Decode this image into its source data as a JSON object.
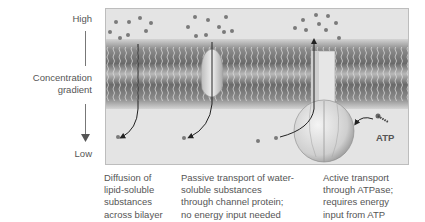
{
  "gradient_axis": {
    "high_label": "High",
    "title_line1": "Concentration",
    "title_line2": "gradient",
    "low_label": "Low"
  },
  "diagram": {
    "atp_label": "ATP",
    "colors": {
      "panel_bg": "#e4e4e4",
      "membrane_dark": "#6e6e6e",
      "membrane_light": "#bdbdbd",
      "molecule": "#7a7a7a",
      "protein": "#d8d8d8"
    }
  },
  "captions": [
    {
      "lines": [
        "Diffusion of",
        "lipid-soluble",
        "substances",
        "across bilayer"
      ]
    },
    {
      "lines": [
        "Passive transport of water-",
        "soluble substances",
        "through channel protein;",
        "no energy input needed"
      ]
    },
    {
      "lines": [
        "Active transport",
        "through ATPase;",
        "requires energy",
        "input from ATP"
      ]
    }
  ]
}
